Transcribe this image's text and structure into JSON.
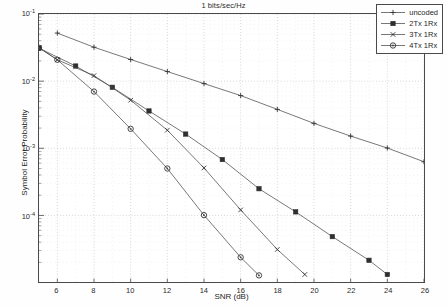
{
  "chart_data": {
    "type": "line",
    "title": "1 bits/sec/Hz",
    "xlabel": "SNR (dB)",
    "ylabel": "Symbol Error Probability",
    "yscale": "log",
    "xlim": [
      5,
      26
    ],
    "ylim": [
      1e-05,
      0.1
    ],
    "xticks": [
      6,
      8,
      10,
      12,
      14,
      16,
      18,
      20,
      22,
      24,
      26
    ],
    "yticks": [
      0.1,
      0.01,
      0.001,
      0.0001
    ],
    "ytick_labels": [
      "10-1",
      "10-2",
      "10-3",
      "10-4"
    ],
    "grid": true,
    "legend_position": "top-right",
    "series": [
      {
        "name": "uncoded",
        "marker": "plus",
        "x": [
          6,
          8,
          10,
          12,
          14,
          16,
          18,
          20,
          22,
          24,
          26
        ],
        "y": [
          0.052,
          0.032,
          0.021,
          0.0139,
          0.0092,
          0.0061,
          0.0038,
          0.00235,
          0.00152,
          0.00101,
          0.00063
        ]
      },
      {
        "name": "2Tx 1Rx",
        "marker": "square-filled",
        "x": [
          5,
          7,
          9,
          11,
          13,
          15,
          17,
          19,
          21,
          23,
          24
        ],
        "y": [
          0.031,
          0.0168,
          0.0081,
          0.0036,
          0.00163,
          0.00068,
          0.00025,
          0.000113,
          4.84e-05,
          2.15e-05,
          1.32e-05
        ]
      },
      {
        "name": "3Tx 1Rx",
        "marker": "x",
        "x": [
          5,
          6,
          8,
          10,
          12,
          14,
          16,
          18,
          19.5
        ],
        "y": [
          0.0315,
          0.0208,
          0.0121,
          0.0052,
          0.00186,
          0.00051,
          0.000121,
          3.11e-05,
          1.32e-05
        ]
      },
      {
        "name": "4Tx 1Rx",
        "marker": "circle",
        "x": [
          5,
          6,
          8,
          10,
          12,
          14,
          16,
          17
        ],
        "y": [
          0.0314,
          0.0208,
          0.007,
          0.00195,
          0.0005,
          0.000101,
          2.38e-05,
          1.28e-05
        ]
      }
    ]
  },
  "legend": {
    "items": [
      {
        "label": "uncoded"
      },
      {
        "label": "2Tx 1Rx"
      },
      {
        "label": "3Tx 1Rx"
      },
      {
        "label": "4Tx 1Rx"
      }
    ]
  }
}
